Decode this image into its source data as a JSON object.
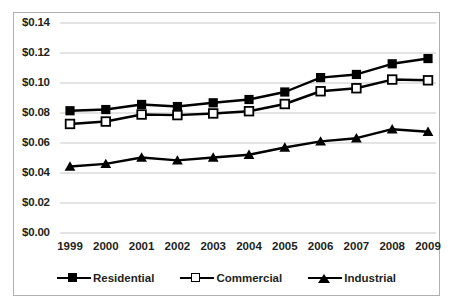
{
  "chart_data": {
    "type": "line",
    "title": "",
    "xlabel": "",
    "ylabel": "",
    "categories": [
      "1999",
      "2000",
      "2001",
      "2002",
      "2003",
      "2004",
      "2005",
      "2006",
      "2007",
      "2008",
      "2009"
    ],
    "ylim": [
      0.0,
      0.14
    ],
    "ytick_step": 0.02,
    "ytick_labels": [
      "$0.00",
      "$0.02",
      "$0.04",
      "$0.06",
      "$0.08",
      "$0.10",
      "$0.12",
      "$0.14"
    ],
    "ytick_values": [
      0.0,
      0.02,
      0.04,
      0.06,
      0.08,
      0.1,
      0.12,
      0.14
    ],
    "grid": true,
    "grid_axis": "y",
    "legend_position": "bottom",
    "series": [
      {
        "name": "Residential",
        "marker": "filled-square",
        "color": "#000000",
        "values": [
          0.0815,
          0.0823,
          0.0857,
          0.0843,
          0.0868,
          0.089,
          0.094,
          0.1036,
          0.1057,
          0.1128,
          0.1163
        ]
      },
      {
        "name": "Commercial",
        "marker": "open-square",
        "color": "#000000",
        "values": [
          0.0727,
          0.0743,
          0.079,
          0.0786,
          0.0797,
          0.0812,
          0.086,
          0.0945,
          0.0965,
          0.1023,
          0.1018
        ]
      },
      {
        "name": "Industrial",
        "marker": "filled-triangle",
        "color": "#000000",
        "values": [
          0.0443,
          0.0461,
          0.0503,
          0.0484,
          0.0503,
          0.0522,
          0.057,
          0.0611,
          0.0632,
          0.0692,
          0.0675
        ]
      }
    ]
  },
  "legend": {
    "items": [
      {
        "label": "Residential",
        "marker": "filled-square"
      },
      {
        "label": "Commercial",
        "marker": "open-square"
      },
      {
        "label": "Industrial",
        "marker": "filled-triangle"
      }
    ]
  }
}
